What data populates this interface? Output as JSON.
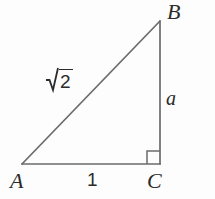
{
  "figure": {
    "kind": "right-triangle-diagram",
    "background_color": "#fdfdfd",
    "stroke_color": "#6b6b6b",
    "text_color": "#2b2b2b",
    "stroke_width": 1.6,
    "vertices": {
      "A": {
        "label": "A",
        "x": 22,
        "y": 164
      },
      "B": {
        "label": "B",
        "x": 160,
        "y": 21
      },
      "C": {
        "label": "C",
        "x": 160,
        "y": 164
      }
    },
    "sides": {
      "hypotenuse": {
        "name": "AB",
        "label_radical": "√",
        "label_radicand": "2",
        "label_text": "√2"
      },
      "vertical": {
        "name": "BC",
        "label_text": "a"
      },
      "base": {
        "name": "AC",
        "label_text": "1"
      }
    },
    "right_angle_marker": {
      "at_vertex": "C",
      "size": 13,
      "visible": true
    }
  }
}
